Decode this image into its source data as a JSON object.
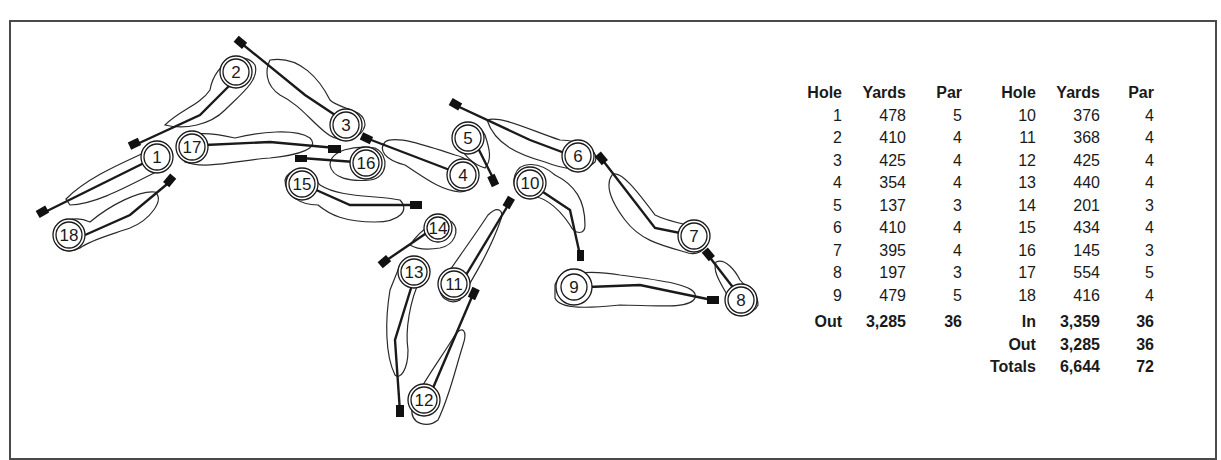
{
  "scorecard": {
    "headers": {
      "hole": "Hole",
      "yards": "Yards",
      "par": "Par"
    },
    "front_nine": [
      {
        "hole": "1",
        "yards": "478",
        "par": "5"
      },
      {
        "hole": "2",
        "yards": "410",
        "par": "4"
      },
      {
        "hole": "3",
        "yards": "425",
        "par": "4"
      },
      {
        "hole": "4",
        "yards": "354",
        "par": "4"
      },
      {
        "hole": "5",
        "yards": "137",
        "par": "3"
      },
      {
        "hole": "6",
        "yards": "410",
        "par": "4"
      },
      {
        "hole": "7",
        "yards": "395",
        "par": "4"
      },
      {
        "hole": "8",
        "yards": "197",
        "par": "3"
      },
      {
        "hole": "9",
        "yards": "479",
        "par": "5"
      }
    ],
    "back_nine": [
      {
        "hole": "10",
        "yards": "376",
        "par": "4"
      },
      {
        "hole": "11",
        "yards": "368",
        "par": "4"
      },
      {
        "hole": "12",
        "yards": "425",
        "par": "4"
      },
      {
        "hole": "13",
        "yards": "440",
        "par": "4"
      },
      {
        "hole": "14",
        "yards": "201",
        "par": "3"
      },
      {
        "hole": "15",
        "yards": "434",
        "par": "4"
      },
      {
        "hole": "16",
        "yards": "145",
        "par": "3"
      },
      {
        "hole": "17",
        "yards": "554",
        "par": "5"
      },
      {
        "hole": "18",
        "yards": "416",
        "par": "4"
      }
    ],
    "out_total": {
      "label": "Out",
      "yards": "3,285",
      "par": "36"
    },
    "in_total": {
      "label": "In",
      "yards": "3,359",
      "par": "36"
    },
    "out_total_right": {
      "label": "Out",
      "yards": "3,285",
      "par": "36"
    },
    "grand_total": {
      "label": "Totals",
      "yards": "6,644",
      "par": "72"
    }
  },
  "course_map": {
    "hole_labels": [
      "1",
      "2",
      "3",
      "4",
      "5",
      "6",
      "7",
      "8",
      "9",
      "10",
      "11",
      "12",
      "13",
      "14",
      "15",
      "16",
      "17",
      "18"
    ],
    "colors": {
      "line": "#1a1a1a",
      "outline": "#2a2a2a",
      "frame": "#4a4a4a"
    }
  }
}
